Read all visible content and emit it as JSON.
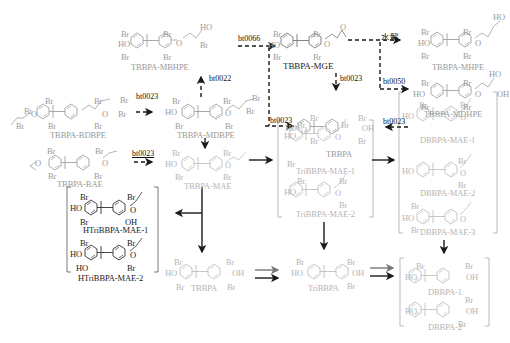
{
  "figure": {
    "colors": {
      "known_compound": "#9a9a9a",
      "new_compound": "#1a1a1a",
      "arrow": "#1a1a1a",
      "bracket": "#888888"
    }
  },
  "compounds": {
    "tbbpa_mbhpe": {
      "name": "TBBPA-MBHPE"
    },
    "tbbpa_mge": {
      "name": "TBBPA-MGE"
    },
    "tbbpa_mhpe": {
      "name": "TBBPA-MHPE"
    },
    "tbbpa_mdhpe": {
      "name": "TBBPA-MDHPE"
    },
    "tbbpa_bdbpe": {
      "name": "TBBPA-BDBPE"
    },
    "tbbpa_mdbpe": {
      "name": "TBBPA-MDBPE"
    },
    "tbbpa_top": {
      "name": "TBBPA"
    },
    "tbbpa_bae": {
      "name": "TBBPA-BAE"
    },
    "tbbpa_mae": {
      "name": "TBBPA-MAE"
    },
    "tribbpa_mae_1": {
      "name": "TriBBPA-MAE-1"
    },
    "tribbpa_mae_2": {
      "name": "TriBBPA-MAE-2"
    },
    "dbbpa_mae_1": {
      "name": "DBBPA-MAE-1"
    },
    "dbbpa_mae_2": {
      "name": "DBBPA-MAE-2"
    },
    "dbbpa_mae_3": {
      "name": "DBBPA-MAE-3"
    },
    "htribbpa_mae_1": {
      "name": "HTriBBPA-MAE-1"
    },
    "htribbpa_mae_2": {
      "name": "HTriBBPA-MAE-2"
    },
    "tbbpa_bottom": {
      "name": "TBBPA"
    },
    "tribbpa": {
      "name": "TriBBPA"
    },
    "dbbpa_1": {
      "name": "DBBPA-1"
    },
    "dbbpa_2": {
      "name": "DBBPA-2"
    }
  },
  "atoms": {
    "br": "Br",
    "ho": "HO",
    "oh": "OH",
    "o": "O"
  },
  "arrows": {
    "bdbpe_to_mdbpe": {
      "label": "bt0023",
      "style": "dashed"
    },
    "mdbpe_to_mbhpe": {
      "label": "bt0022",
      "style": "dashed"
    },
    "mdbpe_to_mge": {
      "label": "bt0066",
      "style": "dashed"
    },
    "mdbpe_to_tbbpa": {
      "label": "bt0023",
      "style": "dashed"
    },
    "mge_to_tbbpa": {
      "label": "bt0023",
      "style": "dashed"
    },
    "mge_to_mhpe": {
      "label": "水解",
      "style": "dashed"
    },
    "mge_to_mdhpe": {
      "label": "bt0050",
      "style": "dashed"
    },
    "mdhpe_to_tbbpa": {
      "label": "bt0023",
      "style": "dashed"
    },
    "bae_to_mae": {
      "label": "bt0023",
      "style": "dashed"
    }
  }
}
